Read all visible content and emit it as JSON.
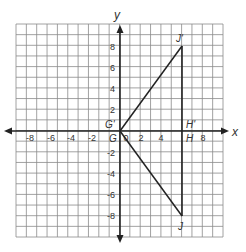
{
  "diagram": {
    "type": "coordinate-plane-reflection",
    "axes": {
      "x_label": "x",
      "y_label": "y",
      "x_range": [
        -10,
        10
      ],
      "y_range": [
        -10,
        10
      ],
      "x_ticks": [
        "-8",
        "-6",
        "-4",
        "-2",
        "0",
        "2",
        "4",
        "8"
      ],
      "y_ticks": [
        "8",
        "6",
        "4",
        "2",
        "-2",
        "-4",
        "-6",
        "-8"
      ],
      "grid_step": 1
    },
    "points": [
      {
        "label": "G",
        "x": 0,
        "y": 0
      },
      {
        "label": "H",
        "x": 6,
        "y": 0
      },
      {
        "label": "J",
        "x": 6,
        "y": -8
      },
      {
        "label": "G'",
        "x": 0,
        "y": 0
      },
      {
        "label": "H'",
        "x": 6,
        "y": 0
      },
      {
        "label": "J'",
        "x": 6,
        "y": 8
      }
    ],
    "triangles": [
      {
        "name": "GHJ",
        "vertices": [
          "G",
          "H",
          "J"
        ]
      },
      {
        "name": "G'H'J'",
        "vertices": [
          "G'",
          "H'",
          "J'"
        ]
      }
    ],
    "colors": {
      "grid": "#8a8a8a",
      "axes": "#222222",
      "lines": "#222222",
      "text": "#333333",
      "background": "#ffffff"
    }
  }
}
